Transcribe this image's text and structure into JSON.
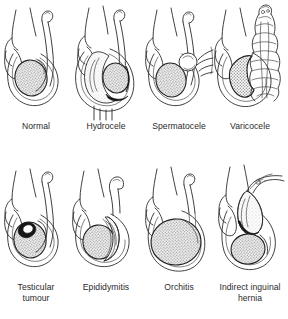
{
  "figure": {
    "background_color": "#ffffff",
    "ink_color": "#2b2b2b",
    "shading_color": "#9a9a9a",
    "rows": 2,
    "columns": 4
  },
  "panels": [
    {
      "id": "normal",
      "label": "Normal",
      "row": 1,
      "column": 1,
      "description": "Normal scrotum with single shaded testis and epididymis, spermatic cord ascending"
    },
    {
      "id": "hydrocele",
      "label": "Hydrocele",
      "row": 1,
      "column": 2,
      "description": "Large fluid collection surrounding and displacing the shaded testis, scrotum markedly enlarged"
    },
    {
      "id": "spermatocele",
      "label": "Spermatocele",
      "row": 1,
      "column": 3,
      "description": "Small round cyst above the testis at the head of the epididymis, with pointing hand"
    },
    {
      "id": "varicocele",
      "label": "Varicocele",
      "row": 1,
      "column": 4,
      "description": "Dilated tortuous pampiniform plexus veins above and around the testis, bag-of-worms appearance"
    },
    {
      "id": "testicular-tumour",
      "label": "Testicular\ntumour",
      "label_lines": [
        "Testicular",
        "tumour"
      ],
      "row": 2,
      "column": 1,
      "description": "Shaded testis containing a dark discrete nodular mass"
    },
    {
      "id": "epididymitis",
      "label": "Epididymitis",
      "row": 2,
      "column": 2,
      "description": "Enlarged inflamed epididymis stippled along the posterior aspect of the testis"
    },
    {
      "id": "orchitis",
      "label": "Orchitis",
      "row": 2,
      "column": 3,
      "description": "Diffusely enlarged shaded testis filling the scrotum"
    },
    {
      "id": "indirect-inguinal-hernia",
      "label": "Indirect inguinal\nhernia",
      "label_lines": [
        "Indirect inguinal",
        "hernia"
      ],
      "row": 2,
      "column": 4,
      "description": "Bowel loop descending through the inguinal canal into the scrotum above the testis"
    }
  ]
}
